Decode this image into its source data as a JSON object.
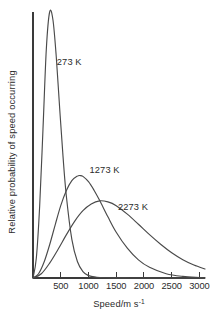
{
  "chart_data": {
    "type": "line",
    "title": "",
    "subtitle": "",
    "xlabel": "Speed/m s",
    "xlabel_superscript": "-1",
    "xlabel_full": "Speed/m s⁻¹",
    "ylabel": "Relative probability of speed occurring",
    "xlim": [
      0,
      3100
    ],
    "ylim": [
      0,
      1.0
    ],
    "grid": false,
    "legend_position": "inline-annotations",
    "x_ticks": [
      500,
      1000,
      1500,
      2000,
      2500,
      3000
    ],
    "x_tick_labels": [
      "500",
      "1000",
      "1500",
      "2000",
      "2500",
      "3000"
    ],
    "y_ticks": [],
    "y_tick_labels": [],
    "series": [
      {
        "name": "273 K",
        "annotation": "273 K",
        "annotation_x": 430,
        "annotation_y": 0.8,
        "peak_speed": 300,
        "peak_value": 1.0,
        "x": [
          0,
          60,
          120,
          180,
          240,
          300,
          360,
          420,
          480,
          540,
          600,
          700,
          800,
          900,
          1000,
          1150,
          1300,
          1500,
          1750,
          2000,
          2300,
          2600,
          3000,
          3100
        ],
        "values": [
          0.0,
          0.075,
          0.27,
          0.56,
          0.86,
          1.0,
          0.97,
          0.83,
          0.64,
          0.46,
          0.31,
          0.145,
          0.062,
          0.024,
          0.009,
          0.003,
          0.001,
          0.0005,
          0.0002,
          0.0001,
          0.0,
          0.0,
          0.0,
          0.0
        ]
      },
      {
        "name": "1273 K",
        "annotation": "1273 K",
        "annotation_x": 1020,
        "annotation_y": 0.395,
        "peak_speed": 850,
        "peak_value": 0.385,
        "x": [
          0,
          100,
          200,
          300,
          400,
          500,
          600,
          700,
          800,
          850,
          900,
          1000,
          1100,
          1200,
          1350,
          1500,
          1700,
          1900,
          2100,
          2400,
          2700,
          3000,
          3100
        ],
        "values": [
          0.0,
          0.016,
          0.06,
          0.125,
          0.2,
          0.272,
          0.328,
          0.366,
          0.383,
          0.385,
          0.382,
          0.362,
          0.33,
          0.292,
          0.23,
          0.172,
          0.112,
          0.068,
          0.04,
          0.016,
          0.006,
          0.002,
          0.001
        ]
      },
      {
        "name": "2273 K",
        "annotation": "2273 K",
        "annotation_x": 1530,
        "annotation_y": 0.255,
        "peak_speed": 1200,
        "peak_value": 0.29,
        "x": [
          0,
          150,
          300,
          450,
          600,
          750,
          900,
          1050,
          1200,
          1350,
          1500,
          1700,
          1900,
          2100,
          2300,
          2500,
          2700,
          2900,
          3100
        ],
        "values": [
          0.0,
          0.016,
          0.056,
          0.107,
          0.162,
          0.213,
          0.253,
          0.278,
          0.29,
          0.286,
          0.272,
          0.24,
          0.202,
          0.163,
          0.127,
          0.095,
          0.069,
          0.049,
          0.034
        ]
      }
    ]
  },
  "layout": {
    "plot_left": 33,
    "plot_right": 205,
    "plot_top": 12,
    "plot_bottom": 278,
    "tick_length": 6,
    "axis_color": "#3a3a3a",
    "curve_color": "#4a4a4a",
    "text_color": "#2b2b2b",
    "background": "#ffffff"
  }
}
